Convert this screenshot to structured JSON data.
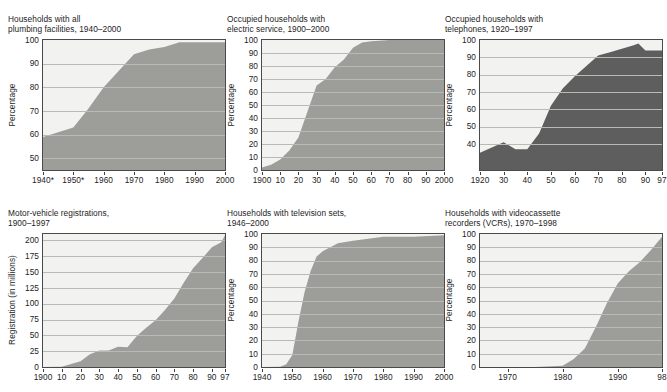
{
  "header": {
    "clipped_text": "··· ··· ·····"
  },
  "colors": {
    "plot_background": "#f2f2f0",
    "gridline": "#b9b9b5",
    "axis_line": "#4a4a4a",
    "area_fill_light": "#9d9d9a",
    "area_fill_dark": "#5e5e5e",
    "text": "#1d1d1d"
  },
  "panels": [
    {
      "id": "plumbing",
      "title": "Households with all\nplumbing facilities, 1940–2000",
      "ylabel": "Percentage",
      "chart_data": {
        "type": "area",
        "title": "Households with all plumbing facilities, 1940–2000",
        "xlabel": "",
        "ylabel": "Percentage",
        "xlim": [
          1940,
          2000
        ],
        "ylim": [
          45,
          100
        ],
        "grid": true,
        "legend": "none",
        "fill": "#9d9d9a",
        "ytick_labels": [
          "100",
          "90",
          "80",
          "70",
          "60",
          "50"
        ],
        "ytick_values": [
          100,
          90,
          80,
          70,
          60,
          50
        ],
        "xtick_labels": [
          "1940*",
          "1950*",
          "1960",
          "1970",
          "1980",
          "1990",
          "2000"
        ],
        "xtick_values": [
          1940,
          1950,
          1960,
          1970,
          1980,
          1990,
          2000
        ],
        "x": [
          1940,
          1945,
          1950,
          1955,
          1960,
          1965,
          1970,
          1975,
          1980,
          1985,
          1990,
          1995,
          2000
        ],
        "values": [
          59,
          61,
          63,
          71,
          80,
          87,
          94,
          96,
          97,
          99,
          99,
          99,
          99
        ],
        "annotations": [
          "* asterisk on 1940 and 1950 tick labels"
        ]
      }
    },
    {
      "id": "electric",
      "title": "Occupied households with\nelectric service, 1900–2000",
      "ylabel": "Percentage",
      "chart_data": {
        "type": "area",
        "title": "Occupied households with electric service, 1900–2000",
        "xlabel": "",
        "ylabel": "Percentage",
        "xlim": [
          1900,
          2000
        ],
        "ylim": [
          0,
          100
        ],
        "grid": true,
        "legend": "none",
        "fill": "#9d9d9a",
        "ytick_labels": [
          "100",
          "90",
          "80",
          "70",
          "60",
          "50",
          "40",
          "30",
          "20",
          "10",
          "0"
        ],
        "ytick_values": [
          100,
          90,
          80,
          70,
          60,
          50,
          40,
          30,
          20,
          10,
          0
        ],
        "xtick_labels": [
          "1900",
          "10",
          "20",
          "30",
          "40",
          "50",
          "60",
          "70",
          "80",
          "90",
          "2000"
        ],
        "xtick_values": [
          1900,
          1910,
          1920,
          1930,
          1940,
          1950,
          1960,
          1970,
          1980,
          1990,
          2000
        ],
        "x": [
          1900,
          1905,
          1910,
          1915,
          1920,
          1925,
          1930,
          1935,
          1940,
          1945,
          1950,
          1955,
          1960,
          1970,
          1980,
          1990,
          2000
        ],
        "values": [
          2,
          4,
          8,
          15,
          25,
          45,
          65,
          70,
          79,
          85,
          94,
          98,
          99,
          100,
          100,
          100,
          100
        ]
      }
    },
    {
      "id": "telephones",
      "title": "Occupied households with\ntelephones, 1920–1997",
      "ylabel": "Percentage",
      "chart_data": {
        "type": "area",
        "title": "Occupied households with telephones, 1920–1997",
        "xlabel": "",
        "ylabel": "Percentage",
        "xlim": [
          1920,
          1997
        ],
        "ylim": [
          25,
          100
        ],
        "grid": true,
        "legend": "none",
        "fill": "#5e5e5e",
        "ytick_labels": [
          "100",
          "90",
          "80",
          "70",
          "60",
          "50",
          "40"
        ],
        "ytick_values": [
          100,
          90,
          80,
          70,
          60,
          50,
          40
        ],
        "xtick_labels": [
          "1920",
          "30",
          "40",
          "50",
          "60",
          "70",
          "80",
          "90",
          "97"
        ],
        "xtick_values": [
          1920,
          1930,
          1940,
          1950,
          1960,
          1970,
          1980,
          1990,
          1997
        ],
        "x": [
          1920,
          1930,
          1935,
          1940,
          1945,
          1950,
          1955,
          1960,
          1965,
          1970,
          1975,
          1980,
          1985,
          1987,
          1990,
          1993,
          1997
        ],
        "values": [
          35,
          41,
          37,
          37,
          46,
          62,
          72,
          79,
          85,
          91,
          93,
          95,
          97,
          98,
          94,
          94,
          94
        ]
      }
    },
    {
      "id": "motor-vehicles",
      "title": "Motor-vehicle registrations,\n1900–1997",
      "ylabel": "Registration (in millions)",
      "chart_data": {
        "type": "area",
        "title": "Motor-vehicle registrations, 1900–1997",
        "xlabel": "",
        "ylabel": "Registration (in millions)",
        "xlim": [
          1900,
          1997
        ],
        "ylim": [
          0,
          210
        ],
        "grid": true,
        "legend": "none",
        "fill": "#9d9d9a",
        "ytick_labels": [
          "200",
          "175",
          "150",
          "125",
          "100",
          "75",
          "50",
          "25",
          "0"
        ],
        "ytick_values": [
          200,
          175,
          150,
          125,
          100,
          75,
          50,
          25,
          0
        ],
        "xtick_labels": [
          "1900",
          "10",
          "20",
          "30",
          "40",
          "50",
          "60",
          "70",
          "80",
          "90",
          "97"
        ],
        "xtick_values": [
          1900,
          1910,
          1920,
          1930,
          1940,
          1950,
          1960,
          1970,
          1980,
          1990,
          1997
        ],
        "x": [
          1900,
          1910,
          1920,
          1925,
          1930,
          1935,
          1940,
          1945,
          1950,
          1955,
          1960,
          1965,
          1970,
          1975,
          1980,
          1985,
          1990,
          1995,
          1997
        ],
        "values": [
          0,
          0.5,
          9,
          20,
          26,
          26,
          32,
          31,
          49,
          62,
          74,
          90,
          108,
          133,
          156,
          172,
          189,
          197,
          208
        ]
      }
    },
    {
      "id": "television",
      "title": "Households with television sets,\n1946–2000",
      "ylabel": "Percentage",
      "chart_data": {
        "type": "area",
        "title": "Households with television sets, 1946–2000",
        "xlabel": "",
        "ylabel": "Percentage",
        "xlim": [
          1940,
          2000
        ],
        "ylim": [
          0,
          100
        ],
        "grid": true,
        "legend": "none",
        "fill": "#9d9d9a",
        "ytick_labels": [
          "100",
          "90",
          "80",
          "70",
          "60",
          "50",
          "40",
          "30",
          "20",
          "10",
          "0"
        ],
        "ytick_values": [
          100,
          90,
          80,
          70,
          60,
          50,
          40,
          30,
          20,
          10,
          0
        ],
        "xtick_labels": [
          "1940",
          "1950",
          "1960",
          "1970",
          "1980",
          "1990",
          "2000"
        ],
        "xtick_values": [
          1940,
          1950,
          1960,
          1970,
          1980,
          1990,
          2000
        ],
        "x": [
          1940,
          1946,
          1948,
          1950,
          1952,
          1954,
          1956,
          1958,
          1960,
          1965,
          1970,
          1980,
          1990,
          2000
        ],
        "values": [
          0,
          0.2,
          2,
          9,
          34,
          56,
          72,
          83,
          87,
          93,
          95,
          98,
          98,
          99
        ]
      }
    },
    {
      "id": "vcr",
      "title": "Households with videocassette\nrecorders (VCRs), 1970–1998",
      "ylabel": "Percentage",
      "chart_data": {
        "type": "area",
        "title": "Households with videocassette recorders (VCRs), 1970–1998",
        "xlabel": "",
        "ylabel": "Percentage",
        "xlim": [
          1965,
          1998
        ],
        "ylim": [
          0,
          100
        ],
        "grid": true,
        "legend": "none",
        "fill": "#9d9d9a",
        "ytick_labels": [
          "100",
          "90",
          "80",
          "70",
          "60",
          "50",
          "40",
          "30",
          "20",
          "10",
          "0"
        ],
        "ytick_values": [
          100,
          90,
          80,
          70,
          60,
          50,
          40,
          30,
          20,
          10,
          0
        ],
        "xtick_labels": [
          "1970",
          "1980",
          "1990",
          "98"
        ],
        "xtick_values": [
          1970,
          1980,
          1990,
          1998
        ],
        "x": [
          1965,
          1970,
          1975,
          1980,
          1982,
          1984,
          1986,
          1988,
          1990,
          1992,
          1994,
          1996,
          1998
        ],
        "values": [
          0,
          0,
          0,
          1,
          6,
          14,
          30,
          48,
          63,
          72,
          79,
          88,
          98
        ]
      }
    }
  ]
}
